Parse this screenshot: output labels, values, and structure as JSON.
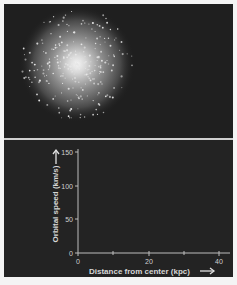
{
  "top_panel": {
    "image": "galaxy-star-cluster",
    "description": "Spherical galaxy of stars, bright center fading outward"
  },
  "chart_data": {
    "type": "line",
    "title": "",
    "xlabel": "Distance from center (kpc)",
    "ylabel": "Orbital speed (km/s)",
    "x_ticks": [
      0,
      20,
      40
    ],
    "x_minor_ticks": [
      10,
      30
    ],
    "y_ticks": [
      0,
      50,
      100,
      150
    ],
    "xlim": [
      0,
      42
    ],
    "ylim": [
      0,
      155
    ],
    "series": [],
    "grid": false,
    "legend": null,
    "annotations": [
      "arrow-right after x label",
      "arrow-up above y label"
    ]
  },
  "labels": {
    "xlabel": "Distance from center (kpc)",
    "ylabel": "Orbital speed (km/s)",
    "x_tick_0": "0",
    "x_tick_20": "20",
    "x_tick_40": "40",
    "y_tick_0": "0",
    "y_tick_50": "50",
    "y_tick_100": "100",
    "y_tick_150": "150"
  },
  "colors": {
    "background": "#222222",
    "axis": "#bdbdbd",
    "text": "#d6d6d6",
    "divider": "#cfcfcf"
  }
}
